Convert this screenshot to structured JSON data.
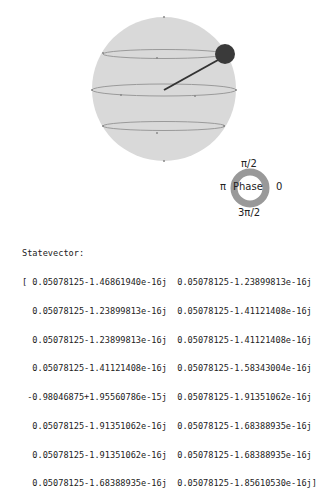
{
  "qsphere": {
    "sphere_color": "#d9d9d9",
    "ring_color": "#9a9a9a",
    "state_color": "#333333",
    "phase_wheel": {
      "center_label": "Phase",
      "top": "π/2",
      "left": "π",
      "right": "0",
      "bottom": "3π/2"
    }
  },
  "statevector": {
    "label": "Statevector:",
    "lines": [
      "[ 0.05078125-1.46861940e-16j  0.05078125-1.23899813e-16j",
      "  0.05078125-1.23899813e-16j  0.05078125-1.41121408e-16j",
      "  0.05078125-1.23899813e-16j  0.05078125-1.41121408e-16j",
      "  0.05078125-1.41121408e-16j  0.05078125-1.58343004e-16j",
      " -0.98046875+1.95560786e-15j  0.05078125-1.91351062e-16j",
      "  0.05078125-1.91351062e-16j  0.05078125-1.68388935e-16j",
      "  0.05078125-1.91351062e-16j  0.05078125-1.68388935e-16j",
      "  0.05078125-1.68388935e-16j  0.05078125-1.85610530e-16j]"
    ]
  }
}
